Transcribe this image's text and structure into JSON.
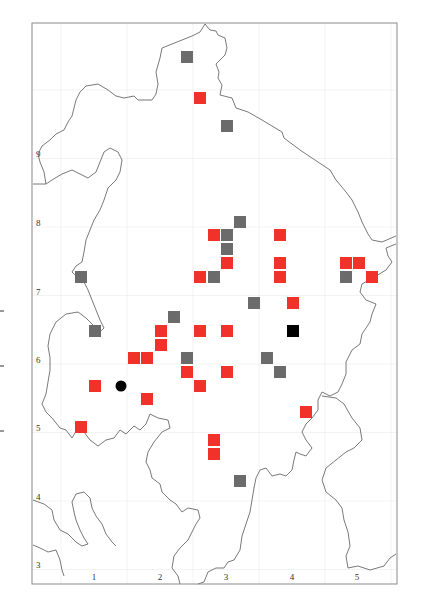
{
  "map": {
    "frame": {
      "left": 32,
      "top": 23,
      "right": 397,
      "bottom": 584
    },
    "x_axis": {
      "ticks": [
        {
          "label": "1",
          "x": 94
        },
        {
          "label": "2",
          "x": 160
        },
        {
          "label": "3",
          "x": 226
        },
        {
          "label": "4",
          "x": 292
        },
        {
          "label": "5",
          "x": 357
        }
      ],
      "label_y": 580
    },
    "y_axis": {
      "ticks": [
        {
          "label": "9",
          "y": 157
        },
        {
          "label": "8",
          "y": 226
        },
        {
          "label": "7",
          "y": 295
        },
        {
          "label": "6",
          "y": 363
        },
        {
          "label": "5",
          "y": 431
        },
        {
          "label": "4",
          "y": 500
        },
        {
          "label": "3",
          "y": 568
        }
      ],
      "label_x": 36
    },
    "colors": {
      "red_marker": "#f0322a",
      "gray_marker": "#6b6b6b",
      "black_marker": "#000000",
      "coastline": "#6a6a6a",
      "frame": "#8a8a8a"
    },
    "markers": {
      "gray_squares": [
        [
          187,
          57
        ],
        [
          227,
          126
        ],
        [
          240,
          222
        ],
        [
          227,
          235
        ],
        [
          227,
          249
        ],
        [
          214,
          277
        ],
        [
          81,
          277
        ],
        [
          254,
          303
        ],
        [
          174,
          317
        ],
        [
          95,
          331
        ],
        [
          187,
          358
        ],
        [
          267,
          358
        ],
        [
          280,
          372
        ],
        [
          346,
          277
        ],
        [
          240,
          481
        ]
      ],
      "red_squares": [
        [
          200,
          98
        ],
        [
          214,
          235
        ],
        [
          280,
          235
        ],
        [
          227,
          263
        ],
        [
          280,
          263
        ],
        [
          346,
          263
        ],
        [
          359,
          263
        ],
        [
          200,
          277
        ],
        [
          280,
          277
        ],
        [
          372,
          277
        ],
        [
          293,
          303
        ],
        [
          161,
          331
        ],
        [
          200,
          331
        ],
        [
          227,
          331
        ],
        [
          161,
          345
        ],
        [
          134,
          358
        ],
        [
          147,
          358
        ],
        [
          187,
          372
        ],
        [
          227,
          372
        ],
        [
          95,
          386
        ],
        [
          200,
          386
        ],
        [
          147,
          399
        ],
        [
          81,
          427
        ],
        [
          306,
          412
        ],
        [
          214,
          440
        ],
        [
          214,
          454
        ]
      ],
      "black_squares": [
        [
          293,
          331
        ]
      ],
      "black_circles": [
        [
          121,
          386
        ]
      ]
    }
  }
}
